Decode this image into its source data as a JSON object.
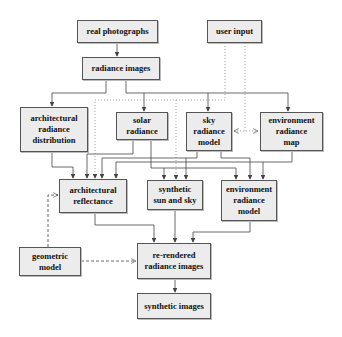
{
  "diagram": {
    "nodes": {
      "real_photographs": "real photographs",
      "user_input": "user input",
      "radiance_images": "radiance images",
      "architectural_radiance_distribution": "architectural\nradiance\ndistribution",
      "solar_radiance": "solar\nradiance",
      "sky_radiance_model": "sky\nradiance\nmodel",
      "environment_radiance_map": "environment\nradiance\nmap",
      "architectural_reflectance": "architectural\nreflectance",
      "synthetic_sun_and_sky": "synthetic\nsun and sky",
      "environment_radiance_model": "environment\nradiance\nmodel",
      "geometric_model": "geometric\nmodel",
      "re_rendered_radiance_images": "re-rendered\nradiance images",
      "synthetic_images": "synthetic images"
    },
    "edges": [
      {
        "from": "real photographs",
        "to": "radiance images",
        "style": "solid"
      },
      {
        "from": "radiance images",
        "to": "architectural radiance distribution",
        "style": "solid"
      },
      {
        "from": "radiance images",
        "to": "solar radiance",
        "style": "solid"
      },
      {
        "from": "radiance images",
        "to": "sky radiance model",
        "style": "solid"
      },
      {
        "from": "radiance images",
        "to": "environment radiance map",
        "style": "solid"
      },
      {
        "from": "user input",
        "to": "architectural reflectance",
        "style": "dotted"
      },
      {
        "from": "user input",
        "to": "synthetic sun and sky",
        "style": "dotted"
      },
      {
        "from": "user input",
        "to": "sky radiance model / environment radiance map",
        "style": "dotted-bidirectional"
      },
      {
        "from": "architectural radiance distribution",
        "to": "architectural reflectance",
        "style": "solid"
      },
      {
        "from": "solar radiance",
        "to": "architectural reflectance",
        "style": "solid"
      },
      {
        "from": "solar radiance",
        "to": "synthetic sun and sky",
        "style": "solid"
      },
      {
        "from": "solar radiance",
        "to": "environment radiance model",
        "style": "solid"
      },
      {
        "from": "sky radiance model",
        "to": "architectural reflectance",
        "style": "solid"
      },
      {
        "from": "sky radiance model",
        "to": "synthetic sun and sky",
        "style": "solid"
      },
      {
        "from": "sky radiance model",
        "to": "environment radiance model",
        "style": "solid"
      },
      {
        "from": "environment radiance map",
        "to": "architectural reflectance",
        "style": "solid"
      },
      {
        "from": "environment radiance map",
        "to": "environment radiance model",
        "style": "solid"
      },
      {
        "from": "geometric model",
        "to": "architectural reflectance",
        "style": "dashed"
      },
      {
        "from": "geometric model",
        "to": "re-rendered radiance images",
        "style": "dashed"
      },
      {
        "from": "architectural reflectance",
        "to": "re-rendered radiance images",
        "style": "solid"
      },
      {
        "from": "synthetic sun and sky",
        "to": "re-rendered radiance images",
        "style": "solid"
      },
      {
        "from": "environment radiance model",
        "to": "re-rendered radiance images",
        "style": "solid"
      },
      {
        "from": "re-rendered radiance images",
        "to": "synthetic images",
        "style": "solid"
      }
    ],
    "colors": {
      "box_fill": "#ececec",
      "box_border": "#555555",
      "line": "#444444",
      "background": "#ffffff"
    }
  }
}
